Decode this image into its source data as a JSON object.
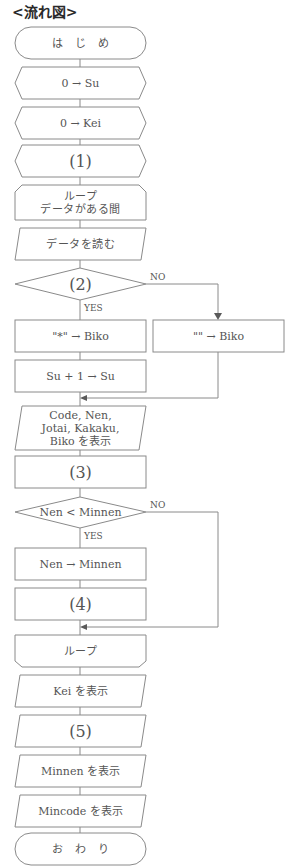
{
  "title": "<流れ図>",
  "nodes": {
    "start": "は　じ　め",
    "init_su": "0 → Su",
    "init_kei": "0 → Kei",
    "blank1": "(1)",
    "loop_start": "ループ\nデータがある間",
    "read_data": "データを読む",
    "blank2": "(2)",
    "set_biko_star": "\"*\" → Biko",
    "set_biko_empty": "\"\" → Biko",
    "increment_su": "Su + 1 → Su",
    "display_record": "Code, Nen,\nJotai, Kakaku,\nBiko を表示",
    "blank3": "(3)",
    "compare_nen": "Nen < Minnen",
    "set_minnen": "Nen → Minnen",
    "blank4": "(4)",
    "loop_end": "ループ",
    "display_kei": "Kei を表示",
    "blank5": "(5)",
    "display_minnen": "Minnen を表示",
    "display_mincode": "Mincode を表示",
    "end": "お　わ　り"
  },
  "branch_labels": {
    "decision2_yes": "YES",
    "decision2_no": "NO",
    "decision_nen_yes": "YES",
    "decision_nen_no": "NO"
  }
}
